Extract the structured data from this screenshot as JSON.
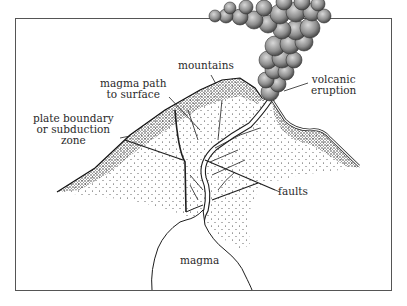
{
  "diagram": {
    "colors": {
      "background": "#ffffff",
      "frame": "#555555",
      "ink": "#1e1e1e",
      "text": "#2a2a2a",
      "smoke": "#8a8a8a"
    },
    "labels": {
      "mountains": "mountains",
      "magma_path_line1": "magma path",
      "magma_path_line2": "to surface",
      "plate_line1": "plate boundary",
      "plate_line2": "or subduction",
      "plate_line3": "zone",
      "volcanic_line1": "volcanic",
      "volcanic_line2": "eruption",
      "faults": "faults",
      "magma": "magma"
    },
    "elements": [
      {
        "name": "frame",
        "type": "rectangle"
      },
      {
        "name": "mountain",
        "type": "stippled-slope"
      },
      {
        "name": "eruption-cloud",
        "type": "smoke-plume"
      },
      {
        "name": "magma-chamber",
        "type": "outline"
      },
      {
        "name": "magma-conduit",
        "type": "double-line-channel"
      },
      {
        "name": "fault-lines",
        "type": "lines"
      }
    ]
  }
}
